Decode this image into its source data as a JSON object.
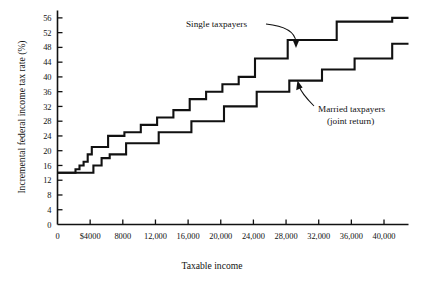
{
  "chart_data": {
    "type": "line",
    "title": "",
    "xlabel": "Taxable income",
    "ylabel": "Incremental federal income tax rate (%)",
    "xlim": [
      0,
      43000
    ],
    "ylim": [
      0,
      58
    ],
    "grid": false,
    "legend_position": "inline-annotations",
    "xticks": [
      0,
      4000,
      8000,
      12000,
      16000,
      20000,
      24000,
      28000,
      32000,
      36000,
      40000
    ],
    "xticklabels": [
      "0",
      "$4000",
      "8000",
      "12,000",
      "16,000",
      "20,000",
      "24,000",
      "28,000",
      "32,000",
      "36,000",
      "40,000"
    ],
    "yticks": [
      0,
      4,
      8,
      12,
      16,
      20,
      24,
      28,
      32,
      36,
      40,
      44,
      48,
      52,
      56
    ],
    "yticklabels": [
      "0",
      "4",
      "8",
      "12",
      "16",
      "20",
      "24",
      "28",
      "32",
      "36",
      "40",
      "44",
      "48",
      "52",
      "56"
    ],
    "series": [
      {
        "name": "Single taxpayers",
        "style": "step-post",
        "x": [
          1700,
          2200,
          2700,
          3200,
          3700,
          4200,
          6200,
          8200,
          10200,
          12200,
          14200,
          16200,
          18200,
          20200,
          22200,
          24200,
          28200,
          34200,
          41000
        ],
        "y": [
          14,
          15,
          16,
          17,
          19,
          21,
          24,
          25,
          27,
          29,
          31,
          34,
          36,
          38,
          40,
          45,
          50,
          55,
          56
        ]
      },
      {
        "name": "Married taxpayers (joint return)",
        "style": "step-post",
        "x": [
          3400,
          4400,
          5400,
          6400,
          8400,
          12400,
          16400,
          20400,
          24400,
          28400,
          32400,
          36400,
          41000
        ],
        "y": [
          14,
          16,
          18,
          19,
          22,
          25,
          28,
          32,
          36,
          39,
          42,
          45,
          49
        ]
      }
    ],
    "annotations": [
      {
        "text": "Single taxpayers",
        "x": 21000,
        "y": 56
      },
      {
        "text": "Married taxpayers",
        "x": 30500,
        "y": 34
      },
      {
        "text": "(joint return)",
        "x": 30500,
        "y": 31
      }
    ]
  },
  "labels": {
    "y_axis_title": "Incremental federal income tax rate (%)",
    "x_axis_title": "Taxable income",
    "anno_single": "Single taxpayers",
    "anno_married_line1": "Married taxpayers",
    "anno_married_line2": "(joint return)"
  },
  "colors": {
    "ink": "#111111",
    "background": "#ffffff"
  }
}
